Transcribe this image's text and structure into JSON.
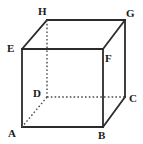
{
  "figure": {
    "name": "cube-diagram",
    "kind": "geometric-solid",
    "solid": "cube",
    "background_color": "#ffffff",
    "stroke_color": "#2b2b2b",
    "hidden_stroke_color": "#4a4a4a",
    "label_color": "#1a1a1a",
    "stroke_width": 1.8,
    "hidden_stroke_width": 1.4,
    "hidden_dash_pattern": "1.6 2.2"
  },
  "vertices": [
    {
      "id": "A",
      "label": "A",
      "x": 22,
      "y": 127,
      "hidden": false,
      "label_x": 8,
      "label_y": 128
    },
    {
      "id": "B",
      "label": "B",
      "x": 103,
      "y": 127,
      "hidden": false,
      "label_x": 98,
      "label_y": 130
    },
    {
      "id": "C",
      "label": "C",
      "x": 125,
      "y": 97,
      "hidden": false,
      "label_x": 129,
      "label_y": 93
    },
    {
      "id": "D",
      "label": "D",
      "x": 47,
      "y": 97,
      "hidden": true,
      "label_x": 33,
      "label_y": 88
    },
    {
      "id": "E",
      "label": "E",
      "x": 22,
      "y": 49,
      "hidden": false,
      "label_x": 7,
      "label_y": 43
    },
    {
      "id": "F",
      "label": "F",
      "x": 103,
      "y": 49,
      "hidden": false,
      "label_x": 105,
      "label_y": 53
    },
    {
      "id": "G",
      "label": "G",
      "x": 125,
      "y": 20,
      "hidden": false,
      "label_x": 126,
      "label_y": 8
    },
    {
      "id": "H",
      "label": "H",
      "x": 47,
      "y": 20,
      "hidden": false,
      "label_x": 38,
      "label_y": 6
    }
  ],
  "edges": [
    {
      "id": "AB",
      "from": "A",
      "to": "B",
      "hidden": false,
      "face": "front-bottom"
    },
    {
      "id": "BF",
      "from": "B",
      "to": "F",
      "hidden": false,
      "face": "front-right"
    },
    {
      "id": "FE",
      "from": "F",
      "to": "E",
      "hidden": false,
      "face": "front-top"
    },
    {
      "id": "EA",
      "from": "E",
      "to": "A",
      "hidden": false,
      "face": "front-left"
    },
    {
      "id": "EH",
      "from": "E",
      "to": "H",
      "hidden": false,
      "face": "top-left-connector"
    },
    {
      "id": "FG",
      "from": "F",
      "to": "G",
      "hidden": false,
      "face": "top-right-connector"
    },
    {
      "id": "BC",
      "from": "B",
      "to": "C",
      "hidden": false,
      "face": "bottom-right-connector"
    },
    {
      "id": "HG",
      "from": "H",
      "to": "G",
      "hidden": false,
      "face": "back-top"
    },
    {
      "id": "GC",
      "from": "G",
      "to": "C",
      "hidden": false,
      "face": "back-right"
    },
    {
      "id": "HD",
      "from": "H",
      "to": "D",
      "hidden": true,
      "face": "back-left"
    },
    {
      "id": "DC",
      "from": "D",
      "to": "C",
      "hidden": true,
      "face": "back-bottom"
    },
    {
      "id": "DA",
      "from": "D",
      "to": "A",
      "hidden": true,
      "face": "bottom-left-connector"
    }
  ]
}
